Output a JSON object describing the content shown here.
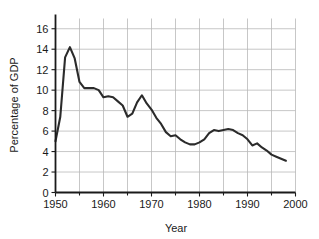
{
  "chart_data": {
    "type": "line",
    "title": "",
    "xlabel": "Year",
    "ylabel": "Percentage of GDP",
    "xlim": [
      1950,
      2000
    ],
    "ylim": [
      0,
      17
    ],
    "grid": true,
    "legend": "none",
    "xticks": [
      1950,
      1960,
      1970,
      1980,
      1990,
      2000
    ],
    "xtick_labels": [
      "1950",
      "1960",
      "1970",
      "1980",
      "1990",
      "2000"
    ],
    "xminor_ticks": [
      1955,
      1965,
      1975,
      1985,
      1995
    ],
    "yticks": [
      0,
      2,
      4,
      6,
      8,
      10,
      12,
      14,
      16
    ],
    "ytick_labels": [
      "0",
      "2",
      "4",
      "6",
      "8",
      "10",
      "12",
      "14",
      "16"
    ],
    "line_color": "#2b2b2b",
    "grid_color": "#b9b9b9",
    "axis_color": "#1a1a1a",
    "series": [
      {
        "name": "Defense spending",
        "x": [
          1950,
          1951,
          1952,
          1953,
          1954,
          1955,
          1956,
          1957,
          1958,
          1959,
          1960,
          1961,
          1962,
          1963,
          1964,
          1965,
          1966,
          1967,
          1968,
          1969,
          1970,
          1971,
          1972,
          1973,
          1974,
          1975,
          1976,
          1977,
          1978,
          1979,
          1980,
          1981,
          1982,
          1983,
          1984,
          1985,
          1986,
          1987,
          1988,
          1989,
          1990,
          1991,
          1992,
          1993,
          1994,
          1995,
          1996,
          1997,
          1998
        ],
        "values": [
          5.0,
          7.4,
          13.2,
          14.2,
          13.1,
          10.8,
          10.2,
          10.2,
          10.2,
          10.0,
          9.3,
          9.4,
          9.3,
          8.9,
          8.5,
          7.4,
          7.7,
          8.8,
          9.5,
          8.7,
          8.1,
          7.3,
          6.7,
          5.9,
          5.5,
          5.6,
          5.2,
          4.9,
          4.7,
          4.7,
          4.9,
          5.2,
          5.8,
          6.1,
          6.0,
          6.1,
          6.2,
          6.1,
          5.8,
          5.6,
          5.2,
          4.6,
          4.8,
          4.4,
          4.1,
          3.7,
          3.5,
          3.3,
          3.1
        ]
      }
    ]
  }
}
